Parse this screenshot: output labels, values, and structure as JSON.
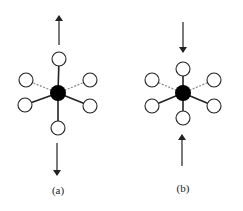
{
  "figure": {
    "panels": [
      {
        "id": "a",
        "label": "(a)",
        "description": "Octahedral center atom with axial ligands pulled outward (tension)",
        "center": {
          "x": 58,
          "y": 93,
          "r": 8
        },
        "ligands": [
          {
            "name": "top",
            "x": 59,
            "y": 59,
            "bond": "solid"
          },
          {
            "name": "bottom",
            "x": 58,
            "y": 128,
            "bond": "solid"
          },
          {
            "name": "upper-left",
            "x": 26,
            "y": 80,
            "bond": "dashed"
          },
          {
            "name": "upper-right",
            "x": 90,
            "y": 80,
            "bond": "dashed"
          },
          {
            "name": "lower-left",
            "x": 25,
            "y": 105,
            "bond": "solid"
          },
          {
            "name": "lower-right",
            "x": 90,
            "y": 106,
            "bond": "solid"
          }
        ],
        "arrows": [
          {
            "name": "arrow-up",
            "x1": 59,
            "y1": 45,
            "x2": 59,
            "y2": 16
          },
          {
            "name": "arrow-down",
            "x1": 57,
            "y1": 143,
            "x2": 57,
            "y2": 175
          }
        ],
        "label_pos": {
          "x": 58,
          "y": 194
        }
      },
      {
        "id": "b",
        "label": "(b)",
        "description": "Octahedral center atom with axial ligands pushed inward (compression)",
        "center": {
          "x": 183,
          "y": 93,
          "r": 8
        },
        "ligands": [
          {
            "name": "top",
            "x": 183,
            "y": 69,
            "bond": "solid"
          },
          {
            "name": "bottom",
            "x": 183,
            "y": 118,
            "bond": "solid"
          },
          {
            "name": "upper-left",
            "x": 152,
            "y": 80,
            "bond": "dashed"
          },
          {
            "name": "upper-right",
            "x": 214,
            "y": 80,
            "bond": "dashed"
          },
          {
            "name": "lower-left",
            "x": 152,
            "y": 106,
            "bond": "solid"
          },
          {
            "name": "lower-right",
            "x": 214,
            "y": 106,
            "bond": "solid"
          }
        ],
        "arrows": [
          {
            "name": "arrow-down",
            "x1": 183,
            "y1": 22,
            "x2": 183,
            "y2": 52
          },
          {
            "name": "arrow-up",
            "x1": 182,
            "y1": 166,
            "x2": 182,
            "y2": 135
          }
        ],
        "label_pos": {
          "x": 183,
          "y": 192
        }
      }
    ],
    "colors": {
      "line": "#222222",
      "dashed": "#888888",
      "center_fill": "#000000",
      "ligand_fill": "#ffffff"
    },
    "ligand_radius": 7
  }
}
